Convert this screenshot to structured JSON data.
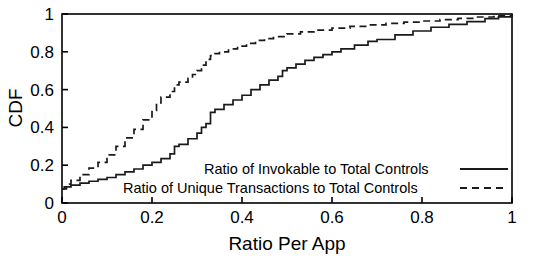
{
  "chart_data": {
    "type": "line",
    "title": "",
    "xlabel": "Ratio Per App",
    "ylabel": "CDF",
    "xlim": [
      0,
      1
    ],
    "ylim": [
      0,
      1
    ],
    "grid": false,
    "legend_position": "bottom-center-inside",
    "xticks": [
      "0",
      "0.2",
      "0.4",
      "0.6",
      "0.8",
      "1"
    ],
    "xtick_values": [
      0,
      0.2,
      0.4,
      0.6,
      0.8,
      1
    ],
    "yticks": [
      "0",
      "0.2",
      "0.4",
      "0.6",
      "0.8",
      "1"
    ],
    "ytick_values": [
      0,
      0.2,
      0.4,
      0.6,
      0.8,
      1
    ],
    "series": [
      {
        "name": "Ratio of Invokable to Total Controls",
        "style": "solid",
        "color": "#1a1a1a",
        "x": [
          0.0,
          0.005,
          0.02,
          0.04,
          0.06,
          0.08,
          0.1,
          0.12,
          0.14,
          0.16,
          0.18,
          0.2,
          0.22,
          0.24,
          0.25,
          0.26,
          0.28,
          0.3,
          0.31,
          0.32,
          0.33,
          0.34,
          0.36,
          0.38,
          0.4,
          0.42,
          0.44,
          0.46,
          0.48,
          0.49,
          0.5,
          0.52,
          0.54,
          0.56,
          0.58,
          0.6,
          0.62,
          0.65,
          0.68,
          0.7,
          0.74,
          0.78,
          0.82,
          0.86,
          0.9,
          0.94,
          0.97,
          1.0
        ],
        "y": [
          0.075,
          0.085,
          0.095,
          0.105,
          0.115,
          0.125,
          0.135,
          0.15,
          0.165,
          0.18,
          0.2,
          0.215,
          0.235,
          0.26,
          0.3,
          0.31,
          0.34,
          0.37,
          0.4,
          0.42,
          0.48,
          0.495,
          0.52,
          0.545,
          0.57,
          0.6,
          0.625,
          0.65,
          0.67,
          0.7,
          0.715,
          0.735,
          0.755,
          0.77,
          0.785,
          0.8,
          0.815,
          0.835,
          0.855,
          0.865,
          0.89,
          0.91,
          0.93,
          0.945,
          0.96,
          0.975,
          0.985,
          1.0
        ]
      },
      {
        "name": "Ratio of Unique Transactions to Total Controls",
        "style": "dashed",
        "color": "#1a1a1a",
        "x": [
          0.0,
          0.01,
          0.02,
          0.04,
          0.06,
          0.08,
          0.1,
          0.12,
          0.14,
          0.16,
          0.18,
          0.2,
          0.21,
          0.22,
          0.24,
          0.25,
          0.26,
          0.28,
          0.29,
          0.3,
          0.31,
          0.32,
          0.33,
          0.34,
          0.35,
          0.37,
          0.39,
          0.41,
          0.43,
          0.45,
          0.47,
          0.5,
          0.53,
          0.56,
          0.6,
          0.64,
          0.68,
          0.72,
          0.76,
          0.8,
          0.84,
          0.88,
          0.92,
          0.96,
          1.0
        ],
        "y": [
          0.075,
          0.1,
          0.12,
          0.15,
          0.185,
          0.215,
          0.255,
          0.3,
          0.345,
          0.39,
          0.44,
          0.49,
          0.53,
          0.56,
          0.59,
          0.625,
          0.64,
          0.66,
          0.68,
          0.7,
          0.73,
          0.76,
          0.78,
          0.79,
          0.8,
          0.815,
          0.83,
          0.845,
          0.86,
          0.87,
          0.88,
          0.895,
          0.905,
          0.915,
          0.925,
          0.935,
          0.942,
          0.95,
          0.957,
          0.963,
          0.97,
          0.977,
          0.984,
          0.992,
          1.0
        ]
      }
    ]
  }
}
